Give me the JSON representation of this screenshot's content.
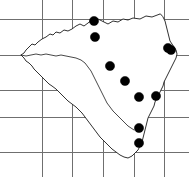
{
  "figure": {
    "name": "distribution-map",
    "type": "dot-distribution-map",
    "region_label": "Czech Republic",
    "width": 189,
    "height": 177,
    "background_color": "#ffffff"
  },
  "chart_data": {
    "type": "scatter",
    "title": "",
    "xlabel": "",
    "ylabel": "",
    "grid": true,
    "legend": false,
    "xlim": [
      0,
      189
    ],
    "ylim": [
      0,
      177
    ],
    "grid_color": "#6f6f6f",
    "outline_color": "#1a1a1a",
    "dot_color": "#000000",
    "dot_radius": 4.6,
    "grid_vertical_x": [
      42,
      72,
      103,
      134,
      164
    ],
    "grid_horizontal_y": [
      19,
      55,
      90,
      117,
      152
    ],
    "dot_count": 10,
    "points": [
      {
        "id": "dot-1",
        "x": 94,
        "y": 21
      },
      {
        "id": "dot-2",
        "x": 95,
        "y": 37
      },
      {
        "id": "dot-3",
        "x": 171,
        "y": 50
      },
      {
        "id": "dot-4",
        "x": 110,
        "y": 66
      },
      {
        "id": "dot-5",
        "x": 125,
        "y": 81
      },
      {
        "id": "dot-6",
        "x": 139,
        "y": 97
      },
      {
        "id": "dot-7",
        "x": 156,
        "y": 96
      },
      {
        "id": "dot-8",
        "x": 139,
        "y": 128
      },
      {
        "id": "dot-9",
        "x": 139,
        "y": 143
      },
      {
        "id": "dot-10",
        "x": 168,
        "y": 48
      }
    ]
  },
  "geometry": {
    "country_path": "M 160 14 L 152 17 L 146 16 L 140 19 L 133 18 L 128 20 L 123 19 L 118 22 L 113 21 L 108 24 L 104 22 L 100 20 L 96 18 L 92 20 L 88 23 L 84 26 L 80 24 L 76 26 L 72 29 L 68 31 L 64 30 L 60 33 L 56 32 L 53 35 L 50 34 L 46 37 L 42 39 L 38 42 L 35 45 L 32 44 L 29 47 L 26 50 L 24 53 L 21 55 L 24 58 L 26 61 L 29 63 L 32 66 L 34 69 L 37 72 L 40 75 L 43 78 L 46 81 L 49 84 L 52 86 L 56 89 L 59 92 L 62 95 L 65 98 L 68 101 L 72 104 L 76 107 L 79 110 L 82 113 L 85 117 L 88 121 L 91 125 L 94 129 L 97 133 L 100 137 L 104 141 L 108 145 L 112 149 L 116 152 L 120 155 L 124 157 L 128 158 L 132 156 L 135 153 L 138 150 L 140 146 L 142 142 L 143 138 L 144 134 L 145 130 L 146 126 L 147 122 L 148 118 L 150 114 L 152 110 L 154 106 L 155 102 L 157 98 L 159 94 L 161 90 L 163 86 L 164 82 L 166 78 L 168 74 L 170 70 L 172 66 L 174 62 L 176 58 L 177 54 L 176 50 L 174 47 L 172 44 L 170 41 L 169 37 L 168 33 L 167 29 L 166 25 L 165 21 L 163 17 Z",
    "divider_path": "M 21 55 L 26 56 L 31 55 L 36 54 L 41 55 L 46 54 L 51 55 L 56 56 L 61 55 L 66 56 L 71 57 L 76 58 L 81 60 L 85 63 L 88 67 L 91 71 L 93 75 L 95 79 L 97 83 L 99 87 L 101 91 L 103 95 L 105 99 L 107 103 L 110 107 L 113 111 L 116 114 L 119 117 L 122 120 L 125 123 L 128 126 L 131 128 L 134 130"
  },
  "accessibility": {
    "description": "Outline map of the Czech Republic overlaid with a rectangular grid and ten filled black circular markers indicating occurrence records, clustered in the north-central, central and eastern parts of the country."
  }
}
